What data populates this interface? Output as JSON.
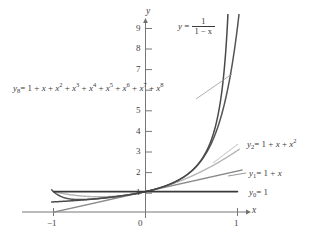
{
  "chart_data": {
    "type": "line",
    "title": "",
    "xlabel": "x",
    "ylabel": "y",
    "xlim": [
      -1.15,
      1.25
    ],
    "ylim": [
      -0.55,
      9.6
    ],
    "grid": false,
    "legend": "inline-labels",
    "x_ticks": [
      -1,
      0,
      1
    ],
    "x_tick_labels": [
      "−1",
      "0",
      "1"
    ],
    "y_ticks": [
      1,
      2,
      3,
      4,
      5,
      6,
      7,
      8,
      9
    ],
    "y_tick_labels": [
      "1",
      "2",
      "3",
      "4",
      "5",
      "6",
      "7",
      "8",
      "9"
    ],
    "y_ticks_visible": [
      1,
      2,
      3,
      4,
      5,
      7,
      8,
      9
    ],
    "series": [
      {
        "name": "y = 1/(1 - x)",
        "kind": "rational",
        "color": "#4a4a4a",
        "width": 1.5,
        "label": "y = 1/(1 − x)",
        "points_x": [
          -1.0,
          -0.9,
          -0.8,
          -0.7,
          -0.6,
          -0.5,
          -0.4,
          -0.3,
          -0.2,
          -0.1,
          0.0,
          0.1,
          0.2,
          0.3,
          0.4,
          0.5,
          0.6,
          0.7,
          0.75,
          0.8,
          0.85,
          0.88,
          0.895
        ],
        "points_y": [
          0.5,
          0.526,
          0.556,
          0.588,
          0.625,
          0.667,
          0.714,
          0.769,
          0.833,
          0.909,
          1.0,
          1.111,
          1.25,
          1.429,
          1.667,
          2.0,
          2.5,
          3.333,
          4.0,
          5.0,
          6.667,
          8.333,
          9.52
        ]
      },
      {
        "name": "y8 = 1 + x + x^2 + x^3 + x^4 + x^5 + x^6 + x^7 + x^8",
        "kind": "polynomial",
        "degree": 8,
        "color": "#555555",
        "width": 1.5,
        "label": "y₈ = 1 + x + x² + x³ + x⁴ + x⁵ + x⁶ + x⁷ + x⁸",
        "points_x": [
          -1.0,
          -0.9,
          -0.8,
          -0.7,
          -0.6,
          -0.5,
          -0.4,
          -0.3,
          -0.2,
          -0.1,
          0.0,
          0.1,
          0.2,
          0.3,
          0.4,
          0.5,
          0.6,
          0.7,
          0.8,
          0.9,
          1.0,
          1.05,
          1.08
        ],
        "points_y": [
          1.0,
          0.521,
          0.556,
          0.588,
          0.625,
          0.667,
          0.714,
          0.769,
          0.833,
          0.909,
          1.0,
          1.111,
          1.25,
          1.428,
          1.664,
          1.992,
          2.458,
          3.118,
          4.057,
          5.372,
          9.0,
          10.9,
          12.2
        ]
      },
      {
        "name": "y2 = 1 + x + x^2",
        "kind": "polynomial",
        "degree": 2,
        "color": "#b4b4b4",
        "width": 1.4,
        "label": "y₂ = 1 + x + x²",
        "points_x": [
          -1.0,
          -0.8,
          -0.6,
          -0.4,
          -0.2,
          0.0,
          0.2,
          0.4,
          0.6,
          0.8,
          1.0
        ],
        "points_y": [
          1.0,
          0.84,
          0.76,
          0.76,
          0.84,
          1.0,
          1.24,
          1.56,
          1.96,
          2.44,
          3.0
        ]
      },
      {
        "name": "y1 = 1 + x",
        "kind": "polynomial",
        "degree": 1,
        "color": "#8a8a8a",
        "width": 1.4,
        "label": "y₁ = 1 + x",
        "points_x": [
          -1.0,
          0.0,
          1.0
        ],
        "points_y": [
          0.0,
          1.0,
          2.0
        ]
      },
      {
        "name": "y0 = 1",
        "kind": "constant",
        "color": "#3a3a3a",
        "width": 1.6,
        "label": "y₀ = 1",
        "points_x": [
          -1.0,
          1.0
        ],
        "points_y": [
          1.0,
          1.0
        ]
      }
    ]
  },
  "axes": {
    "x_axis_name": "x",
    "y_axis_name": "y",
    "tick_neg_one": "−1",
    "tick_zero": "0",
    "tick_one": "1",
    "y1": "1",
    "y2": "2",
    "y3": "3",
    "y4": "4",
    "y5": "5",
    "y7": "7",
    "y8": "8",
    "y9": "9"
  },
  "labels": {
    "rational": {
      "lead": "y",
      "equals": "=",
      "numerator": "1",
      "denominator": "1 − x"
    },
    "poly8": {
      "y": "y",
      "sub": "8",
      "equals": "= 1 + ",
      "x": "x",
      "terms": [
        "2",
        "3",
        "4",
        "5",
        "6",
        "7",
        "8"
      ]
    },
    "poly2": {
      "y": "y",
      "sub": "2",
      "rest": "= 1 + ",
      "x": "x",
      "plus": " + ",
      "x2": "x",
      "exp": "2"
    },
    "poly1": {
      "y": "y",
      "sub": "1",
      "rest": "= 1 + ",
      "x": "x"
    },
    "poly0": {
      "y": "y",
      "sub": "0",
      "rest": "= 1"
    }
  }
}
